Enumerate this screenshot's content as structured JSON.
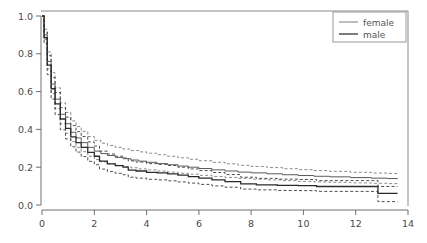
{
  "chart_data": {
    "type": "line",
    "title": "",
    "subtitle": "",
    "xlabel": "",
    "ylabel": "",
    "xlim": [
      0,
      14
    ],
    "ylim": [
      0.0,
      1.0
    ],
    "grid": false,
    "legend_position": "top-right",
    "x_ticks": [
      "0",
      "2",
      "4",
      "6",
      "8",
      "10",
      "12",
      "14"
    ],
    "x_tick_values": [
      0,
      2,
      4,
      6,
      8,
      10,
      12,
      14
    ],
    "y_ticks": [
      "0.0",
      "0.2",
      "0.4",
      "0.6",
      "0.8",
      "1.0"
    ],
    "y_tick_values": [
      0.0,
      0.2,
      0.4,
      0.6,
      0.8,
      1.0
    ],
    "legend": [
      {
        "label": "female",
        "style": "thin-solid"
      },
      {
        "label": "male",
        "style": "thick-solid"
      }
    ],
    "series": [
      {
        "name": "female",
        "style": "solid",
        "x": [
          0,
          0.08,
          0.2,
          0.35,
          0.5,
          0.7,
          0.9,
          1.1,
          1.3,
          1.5,
          1.75,
          2.0,
          2.25,
          2.5,
          2.8,
          3.1,
          3.4,
          3.7,
          4.0,
          4.4,
          4.8,
          5.2,
          5.6,
          6.0,
          6.5,
          7.0,
          7.5,
          8.0,
          8.6,
          9.2,
          9.8,
          10.4,
          11.0,
          11.8,
          12.6,
          13.2,
          13.6
        ],
        "values": [
          1.0,
          0.9,
          0.76,
          0.64,
          0.56,
          0.48,
          0.43,
          0.385,
          0.355,
          0.33,
          0.305,
          0.285,
          0.272,
          0.262,
          0.252,
          0.245,
          0.238,
          0.232,
          0.226,
          0.219,
          0.213,
          0.206,
          0.2,
          0.193,
          0.186,
          0.18,
          0.174,
          0.17,
          0.165,
          0.16,
          0.156,
          0.152,
          0.149,
          0.145,
          0.142,
          0.14,
          0.138
        ]
      },
      {
        "name": "female-upper-ci",
        "style": "dashed",
        "x": [
          0,
          0.08,
          0.2,
          0.35,
          0.5,
          0.7,
          0.9,
          1.1,
          1.3,
          1.5,
          1.75,
          2.0,
          2.25,
          2.5,
          2.8,
          3.1,
          3.4,
          3.7,
          4.0,
          4.4,
          4.8,
          5.2,
          5.6,
          6.0,
          6.5,
          7.0,
          7.5,
          8.0,
          8.6,
          9.2,
          9.8,
          10.4,
          11.0,
          11.8,
          12.6,
          13.2,
          13.6
        ],
        "values": [
          1.0,
          0.93,
          0.81,
          0.7,
          0.62,
          0.54,
          0.49,
          0.445,
          0.415,
          0.39,
          0.362,
          0.342,
          0.327,
          0.315,
          0.305,
          0.296,
          0.288,
          0.281,
          0.274,
          0.266,
          0.258,
          0.25,
          0.242,
          0.234,
          0.226,
          0.218,
          0.21,
          0.204,
          0.198,
          0.192,
          0.187,
          0.182,
          0.178,
          0.173,
          0.169,
          0.167,
          0.165
        ]
      },
      {
        "name": "female-lower-ci",
        "style": "dashed",
        "x": [
          0,
          0.08,
          0.2,
          0.35,
          0.5,
          0.7,
          0.9,
          1.1,
          1.3,
          1.5,
          1.75,
          2.0,
          2.25,
          2.5,
          2.8,
          3.1,
          3.4,
          3.7,
          4.0,
          4.4,
          4.8,
          5.2,
          5.6,
          6.0,
          6.5,
          7.0,
          7.5,
          8.0,
          8.6,
          9.2,
          9.8,
          10.4,
          11.0,
          11.8,
          12.6,
          13.2,
          13.6
        ],
        "values": [
          1.0,
          0.875,
          0.72,
          0.59,
          0.51,
          0.43,
          0.38,
          0.335,
          0.305,
          0.282,
          0.258,
          0.24,
          0.228,
          0.219,
          0.21,
          0.203,
          0.197,
          0.191,
          0.186,
          0.18,
          0.174,
          0.168,
          0.163,
          0.157,
          0.151,
          0.146,
          0.141,
          0.137,
          0.133,
          0.129,
          0.125,
          0.122,
          0.12,
          0.117,
          0.115,
          0.113,
          0.112
        ]
      },
      {
        "name": "male",
        "style": "solid",
        "x": [
          0,
          0.08,
          0.2,
          0.35,
          0.5,
          0.7,
          0.9,
          1.1,
          1.3,
          1.5,
          1.75,
          2.0,
          2.2,
          2.5,
          2.8,
          3.1,
          3.3,
          3.6,
          4.0,
          4.4,
          4.8,
          5.2,
          5.6,
          6.0,
          6.5,
          7.0,
          7.6,
          8.2,
          9.0,
          9.8,
          10.4,
          10.5,
          11.4,
          12.4,
          12.8,
          12.85,
          13.5,
          13.6
        ],
        "values": [
          1.0,
          0.885,
          0.74,
          0.615,
          0.535,
          0.455,
          0.405,
          0.36,
          0.33,
          0.305,
          0.278,
          0.258,
          0.232,
          0.218,
          0.208,
          0.2,
          0.185,
          0.18,
          0.173,
          0.17,
          0.165,
          0.158,
          0.15,
          0.142,
          0.133,
          0.124,
          0.112,
          0.107,
          0.104,
          0.103,
          0.103,
          0.098,
          0.098,
          0.098,
          0.098,
          0.062,
          0.062,
          0.062
        ]
      },
      {
        "name": "male-upper-ci",
        "style": "dashed",
        "x": [
          0,
          0.08,
          0.2,
          0.35,
          0.5,
          0.7,
          0.9,
          1.1,
          1.3,
          1.5,
          1.75,
          2.0,
          2.2,
          2.5,
          2.8,
          3.1,
          3.3,
          3.6,
          4.0,
          4.4,
          4.8,
          5.2,
          5.6,
          6.0,
          6.5,
          7.0,
          7.6,
          8.2,
          9.0,
          9.8,
          10.4,
          10.5,
          11.4,
          12.4,
          12.8,
          12.85,
          13.5,
          13.6
        ],
        "values": [
          1.0,
          0.915,
          0.79,
          0.675,
          0.595,
          0.515,
          0.465,
          0.42,
          0.388,
          0.362,
          0.334,
          0.312,
          0.285,
          0.27,
          0.258,
          0.249,
          0.233,
          0.227,
          0.219,
          0.215,
          0.209,
          0.2,
          0.191,
          0.182,
          0.172,
          0.161,
          0.147,
          0.141,
          0.137,
          0.135,
          0.135,
          0.129,
          0.129,
          0.129,
          0.129,
          0.098,
          0.098,
          0.098
        ]
      },
      {
        "name": "male-lower-ci",
        "style": "dashed",
        "x": [
          0,
          0.08,
          0.2,
          0.35,
          0.5,
          0.7,
          0.9,
          1.1,
          1.3,
          1.5,
          1.75,
          2.0,
          2.2,
          2.5,
          2.8,
          3.1,
          3.3,
          3.6,
          4.0,
          4.4,
          4.8,
          5.2,
          5.6,
          6.0,
          6.5,
          7.0,
          7.6,
          8.2,
          9.0,
          9.8,
          10.4,
          10.5,
          11.4,
          12.4,
          12.8,
          12.85,
          13.5,
          13.6
        ],
        "values": [
          1.0,
          0.855,
          0.69,
          0.56,
          0.478,
          0.398,
          0.35,
          0.308,
          0.28,
          0.256,
          0.231,
          0.213,
          0.19,
          0.177,
          0.168,
          0.16,
          0.147,
          0.142,
          0.136,
          0.133,
          0.128,
          0.122,
          0.116,
          0.109,
          0.101,
          0.094,
          0.084,
          0.08,
          0.077,
          0.076,
          0.076,
          0.072,
          0.072,
          0.072,
          0.072,
          0.018,
          0.018,
          0.018
        ]
      }
    ]
  },
  "colors": {
    "female_line": "#5a5a5a",
    "male_line": "#2a2a2a",
    "axis": "#6e6e6e",
    "background": "#ffffff"
  }
}
